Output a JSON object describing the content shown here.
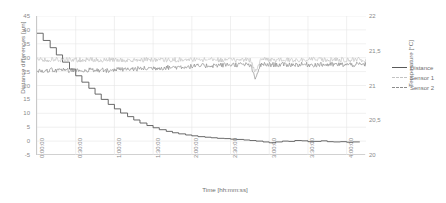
{
  "chart_data": {
    "type": "line",
    "title": "",
    "xlabel": "Time [hh:mm:ss]",
    "ylabel": "Distance differences [µm]",
    "ylabel_right": "Temperature [°C]",
    "grid": true,
    "legend_position": "right-outside",
    "x_tick_labels": [
      "0:00:00",
      "0:30:00",
      "1:00:00",
      "1:30:00",
      "2:00:00",
      "2:30:00",
      "3:00:00",
      "3:30:00",
      "4:00:00"
    ],
    "x_tick_hours": [
      0,
      0.5,
      1,
      1.5,
      2,
      2.5,
      3,
      3.5,
      4
    ],
    "xlim_hours": [
      0,
      4.25
    ],
    "y_tick_labels": [
      "45",
      "40",
      "35",
      "30",
      "25",
      "20",
      "15",
      "10",
      "5",
      "0",
      "-5"
    ],
    "y_values": [
      45,
      40,
      35,
      30,
      25,
      20,
      15,
      10,
      5,
      0,
      -5
    ],
    "ylim": [
      -5,
      45
    ],
    "y2_tick_labels": [
      "22",
      "21,5",
      "21",
      "20,5",
      "20"
    ],
    "y2_values": [
      22,
      21.5,
      21,
      20.5,
      20
    ],
    "y2lim": [
      20,
      22
    ],
    "series": [
      {
        "name": "Distance",
        "axis": "left",
        "color": "#595959",
        "style": "solid",
        "units": "µm",
        "x": [
          0,
          0.08,
          0.17,
          0.25,
          0.33,
          0.42,
          0.5,
          0.58,
          0.67,
          0.75,
          0.83,
          0.92,
          1,
          1.08,
          1.17,
          1.25,
          1.33,
          1.42,
          1.5,
          1.58,
          1.67,
          1.75,
          1.83,
          1.92,
          2,
          2.08,
          2.17,
          2.25,
          2.33,
          2.42,
          2.5,
          2.58,
          2.67,
          2.75,
          2.83,
          2.92,
          3,
          3.08,
          3.17,
          3.25,
          3.33,
          3.42,
          3.5,
          3.58,
          3.67,
          3.75,
          3.83,
          3.92,
          4,
          4.08,
          4.17
        ],
        "values": [
          38.8,
          36.2,
          33.6,
          31.0,
          28.4,
          25.9,
          23.5,
          21.2,
          19.0,
          16.9,
          15.0,
          13.2,
          11.6,
          10.1,
          8.8,
          7.6,
          6.5,
          5.6,
          4.8,
          4.1,
          3.5,
          3.0,
          2.6,
          2.2,
          1.9,
          1.6,
          1.4,
          1.2,
          1.0,
          0.9,
          0.7,
          0.6,
          0.4,
          0.2,
          0.0,
          -0.3,
          -0.6,
          -0.3,
          0.0,
          -0.1,
          0.2,
          0.1,
          -0.2,
          -0.1,
          0.1,
          -0.2,
          -0.3,
          -0.2,
          -0.4,
          -0.3,
          -0.3
        ]
      },
      {
        "name": "Sensor 1",
        "axis": "right",
        "color": "#c3c3c3",
        "style": "dashed",
        "units": "°C",
        "baseline_celsius": 21.37,
        "noise_amplitude_celsius": 0.035,
        "dip_time_hours": 2.82,
        "dip_depth_celsius": 0.16
      },
      {
        "name": "Sensor 2",
        "axis": "right",
        "color": "#8c8c8c",
        "style": "dashed",
        "units": "°C",
        "baseline_celsius": 21.22,
        "baseline_late_celsius": 21.3,
        "noise_amplitude_celsius": 0.035,
        "dip_time_hours": 2.82,
        "dip_depth_celsius": 0.2
      }
    ],
    "legend": [
      {
        "label": "Distance",
        "color": "#595959",
        "style": "solid"
      },
      {
        "label": "Sensor 1",
        "color": "#c3c3c3",
        "style": "dashed"
      },
      {
        "label": "Sensor 2",
        "color": "#8c8c8c",
        "style": "dashed"
      }
    ]
  }
}
